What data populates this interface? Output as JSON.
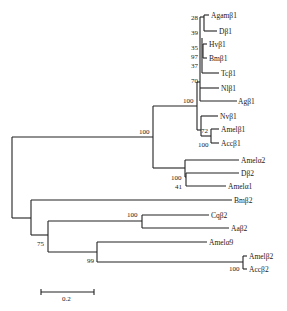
{
  "diagram": {
    "type": "phylogenetic-tree",
    "taxa": [
      {
        "id": "t1",
        "label": "Agamβ1",
        "x": 237,
        "y": 16
      },
      {
        "id": "t2",
        "label": "Dβ1",
        "x": 218,
        "y": 31
      },
      {
        "id": "t3",
        "label": "Hvβ1",
        "x": 220,
        "y": 44
      },
      {
        "id": "t4",
        "label": "Bmβ1",
        "x": 220,
        "y": 58
      },
      {
        "id": "t5",
        "label": "Tcβ1",
        "x": 220,
        "y": 73
      },
      {
        "id": "t6",
        "label": "Nlβ1",
        "x": 220,
        "y": 88
      },
      {
        "id": "t7",
        "label": "Agβ1",
        "x": 237,
        "y": 103
      },
      {
        "id": "t8",
        "label": "Nvβ1",
        "x": 219,
        "y": 116
      },
      {
        "id": "t9",
        "label": "Amelβ1",
        "x": 220,
        "y": 129
      },
      {
        "id": "t10",
        "label": "Accβ1",
        "x": 220,
        "y": 143
      },
      {
        "id": "t11",
        "label": "Amelα2",
        "x": 240,
        "y": 160
      },
      {
        "id": "t12",
        "label": "Dβ2",
        "x": 240,
        "y": 174
      },
      {
        "id": "t13",
        "label": "Amelα1",
        "x": 227,
        "y": 186
      },
      {
        "id": "t14",
        "label": "Bmβ2",
        "x": 233,
        "y": 201
      },
      {
        "id": "t15",
        "label": "Cqβ2",
        "x": 210,
        "y": 215
      },
      {
        "id": "t16",
        "label": "Aaβ2",
        "x": 230,
        "y": 229
      },
      {
        "id": "t17",
        "label": "Amelα9",
        "x": 208,
        "y": 243
      },
      {
        "id": "t18",
        "label": "Amelβ2",
        "x": 248,
        "y": 256
      },
      {
        "id": "t19",
        "label": "Accβ2",
        "x": 248,
        "y": 269
      }
    ],
    "bootstrap": [
      {
        "value": "28",
        "x": 203,
        "y": 19
      },
      {
        "value": "39",
        "x": 203,
        "y": 34
      },
      {
        "value": "35",
        "x": 203,
        "y": 50
      },
      {
        "value": "97",
        "x": 203,
        "y": 59
      },
      {
        "value": "37",
        "x": 203,
        "y": 68
      },
      {
        "value": "70",
        "x": 203,
        "y": 83
      },
      {
        "value": "100",
        "x": 186,
        "y": 102
      },
      {
        "value": "72",
        "x": 205,
        "y": 132
      },
      {
        "value": "100",
        "x": 205,
        "y": 146
      },
      {
        "value": "100",
        "x": 130,
        "y": 132
      },
      {
        "value": "100",
        "x": 170,
        "y": 179
      },
      {
        "value": "41",
        "x": 175,
        "y": 188
      },
      {
        "value": "100",
        "x": 127,
        "y": 216
      },
      {
        "value": "75",
        "x": 37,
        "y": 245
      },
      {
        "value": "99",
        "x": 82,
        "y": 262
      },
      {
        "value": "100",
        "x": 226,
        "y": 270
      }
    ],
    "scale_bar": {
      "label": "0.2",
      "x1": 41,
      "x2": 94,
      "y": 292
    }
  }
}
